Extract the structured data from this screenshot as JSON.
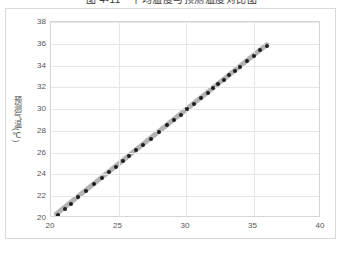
{
  "chart_data": {
    "type": "scatter",
    "title": "图 4-11　平均温度与预测温度对比图",
    "xlabel": "",
    "ylabel": "预测气温(℃)",
    "xlim": [
      20,
      40
    ],
    "ylim": [
      20,
      38
    ],
    "xticks": [
      20,
      25,
      30,
      35,
      40
    ],
    "yticks": [
      20,
      22,
      24,
      26,
      28,
      30,
      32,
      34,
      36,
      38
    ],
    "grid": true,
    "legend": false,
    "marker_color": "#1d1d1d",
    "trendline_color": "#b3b3b3",
    "series": [
      {
        "name": "温度散点",
        "points": [
          [
            20.5,
            20.3
          ],
          [
            21.0,
            20.8
          ],
          [
            21.5,
            21.3
          ],
          [
            22.0,
            21.9
          ],
          [
            22.6,
            22.5
          ],
          [
            23.2,
            23.1
          ],
          [
            23.8,
            23.7
          ],
          [
            24.3,
            24.2
          ],
          [
            24.8,
            24.7
          ],
          [
            25.3,
            25.2
          ],
          [
            25.8,
            25.7
          ],
          [
            26.3,
            26.2
          ],
          [
            26.8,
            26.7
          ],
          [
            27.4,
            27.3
          ],
          [
            28.0,
            27.9
          ],
          [
            28.6,
            28.5
          ],
          [
            29.1,
            29.0
          ],
          [
            29.6,
            29.5
          ],
          [
            30.1,
            30.0
          ],
          [
            30.6,
            30.5
          ],
          [
            31.1,
            31.0
          ],
          [
            31.6,
            31.5
          ],
          [
            32.0,
            31.9
          ],
          [
            32.4,
            32.3
          ],
          [
            32.8,
            32.7
          ],
          [
            33.2,
            33.1
          ],
          [
            33.6,
            33.5
          ],
          [
            34.0,
            33.9
          ],
          [
            34.5,
            34.4
          ],
          [
            35.0,
            34.9
          ],
          [
            35.5,
            35.4
          ],
          [
            36.0,
            35.8
          ]
        ]
      }
    ],
    "trendline": {
      "x0": 20.4,
      "y0": 20.2,
      "x1": 36.1,
      "y1": 35.9
    }
  }
}
